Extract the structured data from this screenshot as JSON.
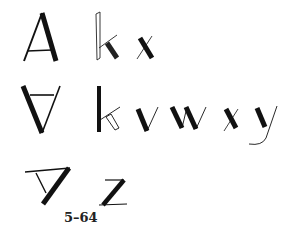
{
  "figure": {
    "caption": "5–64",
    "rows": [
      {
        "name": "row-1",
        "letters": [
          "A",
          "k",
          "x"
        ]
      },
      {
        "name": "row-2",
        "letters": [
          "∀",
          "k",
          "v",
          "w",
          "x",
          "y"
        ]
      },
      {
        "name": "row-3",
        "letters": [
          "∇",
          "z"
        ]
      }
    ],
    "ink_color": "#111111",
    "background": "#ffffff"
  }
}
